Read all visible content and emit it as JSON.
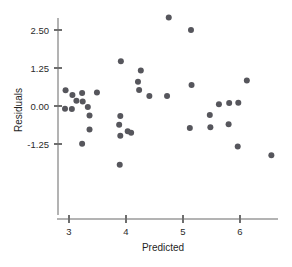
{
  "chart_data": {
    "type": "scatter",
    "title": "",
    "xlabel": "Predicted",
    "ylabel": "Residuals",
    "xlim": [
      2.7,
      6.8
    ],
    "ylim": [
      -2.2,
      3.1
    ],
    "xticks": [
      3,
      4,
      5,
      6
    ],
    "xticklabels": [
      "3",
      "4",
      "5",
      "6"
    ],
    "yticks": [
      2.5,
      1.25,
      0.0,
      -1.25
    ],
    "yticklabels": [
      "2.50",
      "1.25",
      "0.00",
      "-1.25"
    ],
    "grid": false,
    "legend": null,
    "marker": {
      "shape": "circle",
      "color": "#56565c",
      "size": 3.0
    },
    "points": [
      {
        "x": 2.93,
        "y": -0.09
      },
      {
        "x": 2.94,
        "y": 0.52
      },
      {
        "x": 3.06,
        "y": 0.36
      },
      {
        "x": 3.05,
        "y": -0.1
      },
      {
        "x": 3.13,
        "y": 0.17
      },
      {
        "x": 3.23,
        "y": 0.43
      },
      {
        "x": 3.24,
        "y": 0.15
      },
      {
        "x": 3.23,
        "y": -1.24
      },
      {
        "x": 3.33,
        "y": -0.03
      },
      {
        "x": 3.36,
        "y": -0.31
      },
      {
        "x": 3.36,
        "y": -0.77
      },
      {
        "x": 3.49,
        "y": 0.44
      },
      {
        "x": 3.91,
        "y": 1.47
      },
      {
        "x": 3.9,
        "y": -0.33
      },
      {
        "x": 3.88,
        "y": -0.62
      },
      {
        "x": 3.9,
        "y": -0.98
      },
      {
        "x": 3.89,
        "y": -1.93
      },
      {
        "x": 4.03,
        "y": -0.83
      },
      {
        "x": 4.09,
        "y": -0.88
      },
      {
        "x": 4.21,
        "y": 0.8
      },
      {
        "x": 4.26,
        "y": 1.17
      },
      {
        "x": 4.23,
        "y": 0.53
      },
      {
        "x": 4.41,
        "y": 0.33
      },
      {
        "x": 4.72,
        "y": 0.33
      },
      {
        "x": 4.75,
        "y": 2.91
      },
      {
        "x": 5.14,
        "y": 2.5
      },
      {
        "x": 5.15,
        "y": 0.69
      },
      {
        "x": 5.12,
        "y": -0.72
      },
      {
        "x": 5.47,
        "y": -0.3
      },
      {
        "x": 5.48,
        "y": -0.7
      },
      {
        "x": 5.63,
        "y": 0.06
      },
      {
        "x": 5.81,
        "y": 0.1
      },
      {
        "x": 5.8,
        "y": -0.6
      },
      {
        "x": 5.97,
        "y": 0.11
      },
      {
        "x": 5.96,
        "y": -1.33
      },
      {
        "x": 6.12,
        "y": 0.84
      },
      {
        "x": 6.55,
        "y": -1.62
      }
    ]
  }
}
